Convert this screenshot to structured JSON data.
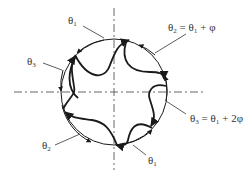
{
  "diagram": {
    "type": "rotational-symmetry-sketch",
    "center": {
      "x": 114,
      "y": 92
    },
    "radius": 53,
    "axes": {
      "horizontal": {
        "x1": 14,
        "x2": 205,
        "y": 92
      },
      "vertical": {
        "x": 114,
        "y1": 8,
        "y2": 170
      },
      "style": "dash-dot"
    },
    "arm_count": 5,
    "stroke_color": "#1a1a1a",
    "axis_color": "#555555",
    "text_color": "#333333"
  },
  "labels": [
    {
      "id": "theta1-top",
      "base": "θ",
      "sub": "1",
      "rest": "",
      "x": 68,
      "y": 15,
      "leader": [
        83,
        26,
        104,
        38
      ]
    },
    {
      "id": "theta3-left",
      "base": "θ",
      "sub": "3",
      "rest": "",
      "x": 27,
      "y": 56,
      "leader": [
        43,
        63,
        62,
        70
      ]
    },
    {
      "id": "theta2-formula",
      "base": "θ",
      "sub": "2",
      "rest": "= θ₁ + φ",
      "x": 168,
      "y": 22,
      "leader": [
        186,
        34,
        155,
        53
      ]
    },
    {
      "id": "theta3-formula",
      "base": "θ",
      "sub": "3",
      "rest": "= θ₁ + 2φ",
      "x": 190,
      "y": 113,
      "leader": [
        186,
        114,
        166,
        101
      ]
    },
    {
      "id": "theta2-left",
      "base": "θ",
      "sub": "2",
      "rest": "",
      "x": 42,
      "y": 140,
      "leader": [
        55,
        145,
        80,
        133
      ]
    },
    {
      "id": "theta1-bottom",
      "base": "θ",
      "sub": "1",
      "rest": "",
      "x": 148,
      "y": 155,
      "leader": [
        146,
        155,
        133,
        145
      ]
    }
  ]
}
